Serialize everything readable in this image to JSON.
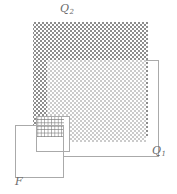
{
  "figure": {
    "type": "geometric-diagram",
    "background_color": "#ffffff",
    "width": 177,
    "height": 194
  },
  "labels": {
    "q2": {
      "base": "Q",
      "subscript": "2",
      "text": "Q2",
      "x": 60,
      "y": 3,
      "color": "#6a6a6a"
    },
    "q1": {
      "base": "Q",
      "subscript": "1",
      "text": "Q1",
      "x": 152,
      "y": 145,
      "color": "#6a6a6a"
    },
    "f": {
      "base": "F",
      "subscript": "",
      "text": "F",
      "x": 15,
      "y": 176,
      "color": "#6a6a6a"
    }
  },
  "shapes": {
    "q2_square": {
      "name": "Q2",
      "x": 33,
      "y": 22,
      "width": 115,
      "height": 115,
      "fill_pattern": "dense-checkerboard",
      "fill_color": "#8d8d8d",
      "stroke": "none"
    },
    "q1_square": {
      "name": "Q1-inner-fill",
      "x": 47,
      "y": 60,
      "width": 99,
      "height": 82,
      "fill_pattern": "light-checkerboard",
      "fill_color": "#c9c9c9",
      "stroke": "none"
    },
    "q1_outline": {
      "name": "Q1-outline",
      "x": 47,
      "y": 60,
      "width": 112,
      "height": 97,
      "fill": "none",
      "stroke": "#a8a8a8",
      "stroke_width": 1
    },
    "f_square": {
      "name": "F",
      "x": 15,
      "y": 125,
      "width": 49,
      "height": 53,
      "fill": "none",
      "stroke": "#a8a8a8",
      "stroke_width": 1
    },
    "f_inner_outline": {
      "name": "F-inner-outline",
      "x": 36,
      "y": 116,
      "width": 34,
      "height": 36,
      "fill": "none",
      "stroke": "#a8a8a8",
      "stroke_width": 1
    },
    "overlap_fine_grid": {
      "name": "F-intersect-Q2",
      "x": 36,
      "y": 120,
      "width": 28,
      "height": 19,
      "fill_pattern": "fine-grid",
      "grid_color": "#777777"
    }
  },
  "colors": {
    "dark_hatch": "#8d8d8d",
    "light_hatch": "#c9c9c9",
    "outline": "#a8a8a8",
    "label": "#6a6a6a",
    "background": "#ffffff"
  }
}
